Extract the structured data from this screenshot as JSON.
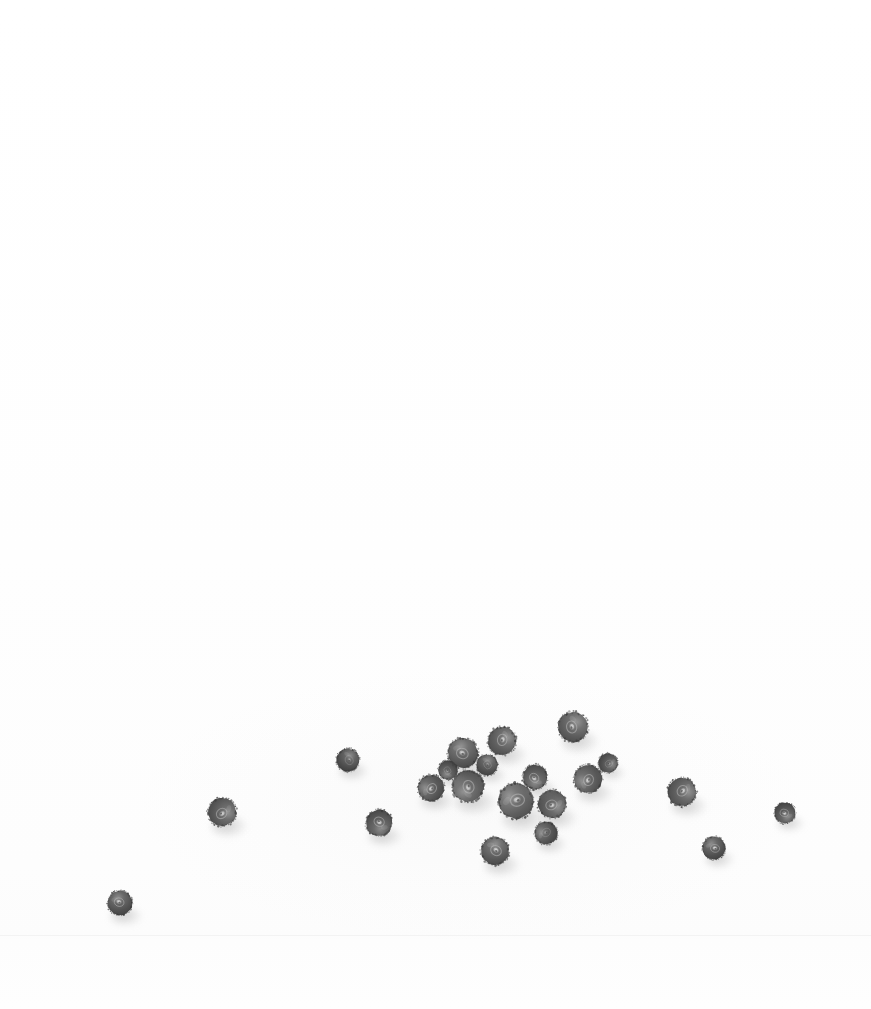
{
  "image": {
    "title": "Scattered blueberries on a white surface",
    "subject": "blueberries",
    "subject_count": 21,
    "rendering": "grayscale photograph",
    "orientation": "portrait",
    "width": 871,
    "height": 1009,
    "background_description": "plain bright white seamless surface",
    "lighting": "soft diffuse light from upper-left, shadows cast toward lower-right",
    "composition": "subjects clustered in the lower-middle third of the frame; upper two-thirds empty white"
  },
  "palette": {
    "background": "#fefefe",
    "surface_low": "#fcfcfc",
    "seam_line": "#f2f2f2",
    "berry_dark": "#454545",
    "berry_mid": "#5e5e5e",
    "berry_rim": "#7d7d7d",
    "berry_crown_light": "#b9b9b9",
    "berry_crown_highlight": "#dcdcdc",
    "shadow": "#9c9c9c"
  },
  "surface": {
    "seam_y": 935,
    "haze": {
      "cx": 470,
      "cy": 805,
      "rx": 330,
      "ry": 135
    }
  },
  "berries": [
    {
      "id": 1,
      "label": "berry-far-left-low",
      "cx": 120,
      "cy": 903,
      "r": 14,
      "rot": 18,
      "tone": 0.93,
      "crown": "bright"
    },
    {
      "id": 2,
      "label": "berry-left",
      "cx": 222,
      "cy": 812,
      "r": 16,
      "rot": 140,
      "tone": 0.9,
      "crown": "bright"
    },
    {
      "id": 3,
      "label": "berry-left-upper",
      "cx": 348,
      "cy": 760,
      "r": 13,
      "rot": 65,
      "tone": 0.95,
      "crown": "dim"
    },
    {
      "id": 4,
      "label": "berry-left-lower",
      "cx": 379,
      "cy": 823,
      "r": 15,
      "rot": 205,
      "tone": 0.92,
      "crown": "bright"
    },
    {
      "id": 5,
      "label": "berry-inner-left",
      "cx": 431,
      "cy": 788,
      "r": 15,
      "rot": 310,
      "tone": 0.91,
      "crown": "bright"
    },
    {
      "id": 6,
      "label": "berry-center-upper-left",
      "cx": 463,
      "cy": 753,
      "r": 17,
      "rot": 25,
      "tone": 0.88,
      "crown": "bright"
    },
    {
      "id": 7,
      "label": "berry-center-mid-left",
      "cx": 468,
      "cy": 786,
      "r": 18,
      "rot": 255,
      "tone": 0.86,
      "crown": "bright"
    },
    {
      "id": 8,
      "label": "berry-center-top",
      "cx": 502,
      "cy": 741,
      "r": 16,
      "rot": 100,
      "tone": 0.87,
      "crown": "bright"
    },
    {
      "id": 9,
      "label": "berry-center-large",
      "cx": 516,
      "cy": 801,
      "r": 20,
      "rot": 345,
      "tone": 0.84,
      "crown": "bright"
    },
    {
      "id": 10,
      "label": "berry-center-lower",
      "cx": 552,
      "cy": 804,
      "r": 16,
      "rot": 160,
      "tone": 0.89,
      "crown": "bright"
    },
    {
      "id": 11,
      "label": "berry-center-bottom",
      "cx": 495,
      "cy": 851,
      "r": 16,
      "rot": 40,
      "tone": 0.88,
      "crown": "bright"
    },
    {
      "id": 12,
      "label": "berry-center-right-mid",
      "cx": 535,
      "cy": 777,
      "r": 14,
      "rot": 220,
      "tone": 0.9,
      "crown": "bright"
    },
    {
      "id": 13,
      "label": "berry-upper-right",
      "cx": 573,
      "cy": 727,
      "r": 17,
      "rot": 75,
      "tone": 0.87,
      "crown": "bright"
    },
    {
      "id": 14,
      "label": "berry-right-mid",
      "cx": 588,
      "cy": 779,
      "r": 16,
      "rot": 290,
      "tone": 0.89,
      "crown": "bright"
    },
    {
      "id": 15,
      "label": "berry-right-outer",
      "cx": 682,
      "cy": 792,
      "r": 16,
      "rot": 130,
      "tone": 0.88,
      "crown": "bright"
    },
    {
      "id": 16,
      "label": "berry-right-low",
      "cx": 714,
      "cy": 848,
      "r": 13,
      "rot": 10,
      "tone": 0.93,
      "crown": "bright"
    },
    {
      "id": 17,
      "label": "berry-far-right",
      "cx": 785,
      "cy": 813,
      "r": 12,
      "rot": 195,
      "tone": 0.94,
      "crown": "bright"
    },
    {
      "id": 18,
      "label": "berry-inner-right-low",
      "cx": 546,
      "cy": 833,
      "r": 13,
      "rot": 320,
      "tone": 0.92,
      "crown": "dim"
    },
    {
      "id": 19,
      "label": "berry-inner-upper",
      "cx": 487,
      "cy": 765,
      "r": 12,
      "rot": 55,
      "tone": 0.93,
      "crown": "dim"
    },
    {
      "id": 20,
      "label": "berry-center-left-small",
      "cx": 448,
      "cy": 770,
      "r": 11,
      "rot": 240,
      "tone": 0.94,
      "crown": "dim"
    },
    {
      "id": 21,
      "label": "berry-right-tiny",
      "cx": 608,
      "cy": 763,
      "r": 11,
      "rot": 150,
      "tone": 0.94,
      "crown": "dim"
    }
  ]
}
